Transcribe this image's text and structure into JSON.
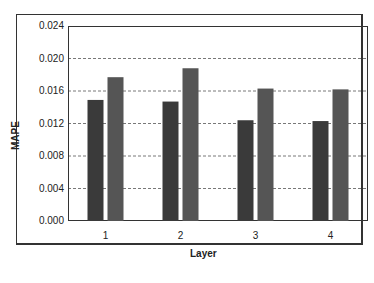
{
  "chart_data": {
    "type": "bar",
    "title": "",
    "xlabel": "Layer",
    "ylabel": "MAPE",
    "categories": [
      "1",
      "2",
      "3",
      "4"
    ],
    "series": [
      {
        "name": "Series 1",
        "values": [
          0.0149,
          0.0147,
          0.0124,
          0.0123
        ],
        "color": "#3a3a3a"
      },
      {
        "name": "Series 2",
        "values": [
          0.0177,
          0.0188,
          0.0163,
          0.0162
        ],
        "color": "#555555"
      }
    ],
    "ylim": [
      0,
      0.024
    ],
    "yticks": [
      "0.000",
      "0.004",
      "0.008",
      "0.012",
      "0.016",
      "0.020",
      "0.024"
    ],
    "grid": true,
    "legend": "none"
  }
}
